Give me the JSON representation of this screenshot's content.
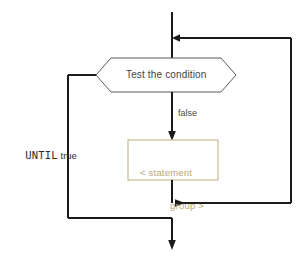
{
  "diagram": {
    "colors": {
      "line": "#1a1a1a",
      "hexagon_border": "#5b5b5b",
      "statement_border": "#c9bb93",
      "statement_text": "#b9a877",
      "background": "#ffffff"
    },
    "nodes": {
      "decision": {
        "label": "Test the condition",
        "shape": "hexagon"
      },
      "statement": {
        "line1": "< statement",
        "line2": "group >",
        "shape": "rectangle"
      }
    },
    "edge_labels": {
      "false_branch": "false",
      "until_branch_keyword": "UNTIL",
      "until_branch_value": "true"
    }
  }
}
